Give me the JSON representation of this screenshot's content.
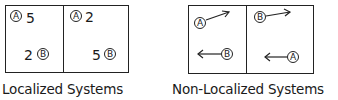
{
  "localized": {
    "caption": "Localized Systems",
    "left_cell": {
      "a_label": "A",
      "a_value": "5",
      "b_label": "B",
      "b_value": "2"
    },
    "right_cell": {
      "a_label": "A",
      "a_value": "2",
      "b_label": "B",
      "b_value": "5"
    }
  },
  "non_localized": {
    "caption": "Non-Localized Systems",
    "left_cell": {
      "top_label": "A",
      "top_arrow": "up-right",
      "bottom_label": "B",
      "bottom_arrow": "left"
    },
    "right_cell": {
      "top_label": "B",
      "top_arrow": "up-right",
      "bottom_label": "A",
      "bottom_arrow": "left"
    }
  }
}
